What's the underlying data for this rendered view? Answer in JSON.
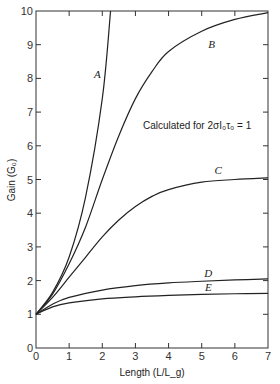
{
  "chart_data": {
    "type": "line",
    "title": "",
    "annotation": "Calculated for 2σI₀τ₀ = 1",
    "xlabel": "Length (L/L_g)",
    "ylabel": "Gain (G₀)",
    "xlim": [
      0,
      7
    ],
    "ylim": [
      0,
      10
    ],
    "xticks": [
      0,
      1,
      2,
      3,
      4,
      5,
      6,
      7
    ],
    "yticks": [
      0,
      1,
      2,
      3,
      4,
      5,
      6,
      7,
      8,
      9,
      10
    ],
    "grid": false,
    "legend": "inline curve labels",
    "series": [
      {
        "name": "A",
        "x": [
          0,
          0.5,
          1,
          1.5,
          2,
          2.25
        ],
        "y": [
          1,
          1.65,
          2.7,
          4.5,
          7.4,
          10
        ]
      },
      {
        "name": "B",
        "x": [
          0,
          0.5,
          1,
          1.5,
          2,
          2.5,
          3,
          3.5,
          4,
          5,
          6,
          7
        ],
        "y": [
          1,
          1.6,
          2.5,
          3.6,
          5.0,
          6.3,
          7.4,
          8.2,
          8.8,
          9.4,
          9.75,
          9.95
        ]
      },
      {
        "name": "C",
        "x": [
          0,
          0.5,
          1,
          1.5,
          2,
          2.5,
          3,
          3.5,
          4,
          5,
          6,
          7
        ],
        "y": [
          1,
          1.5,
          2.1,
          2.7,
          3.3,
          3.8,
          4.2,
          4.5,
          4.7,
          4.92,
          5.0,
          5.05
        ]
      },
      {
        "name": "D",
        "x": [
          0,
          0.5,
          1,
          2,
          3,
          4,
          5,
          6,
          7
        ],
        "y": [
          1,
          1.3,
          1.5,
          1.72,
          1.85,
          1.93,
          1.98,
          2.02,
          2.05
        ]
      },
      {
        "name": "E",
        "x": [
          0,
          0.5,
          1,
          2,
          3,
          4,
          5,
          6,
          7
        ],
        "y": [
          1,
          1.22,
          1.34,
          1.46,
          1.52,
          1.56,
          1.59,
          1.61,
          1.62
        ]
      }
    ],
    "curve_labels": [
      {
        "name": "A",
        "x": 1.85,
        "y": 8.0
      },
      {
        "name": "B",
        "x": 5.3,
        "y": 8.9
      },
      {
        "name": "C",
        "x": 5.5,
        "y": 5.15
      },
      {
        "name": "D",
        "x": 5.2,
        "y": 2.12
      },
      {
        "name": "E",
        "x": 5.2,
        "y": 1.7
      }
    ]
  }
}
